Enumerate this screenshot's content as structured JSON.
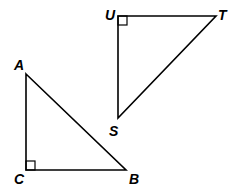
{
  "diagram": {
    "triangles": [
      {
        "name": "ABC",
        "right_angle_at": "C",
        "vertices": {
          "A": {
            "x": 26,
            "y": 74
          },
          "B": {
            "x": 126,
            "y": 170
          },
          "C": {
            "x": 26,
            "y": 170
          }
        }
      },
      {
        "name": "UST",
        "right_angle_at": "U",
        "vertices": {
          "U": {
            "x": 118,
            "y": 16
          },
          "T": {
            "x": 216,
            "y": 16
          },
          "S": {
            "x": 118,
            "y": 118
          }
        }
      }
    ],
    "labels": {
      "A": "A",
      "B": "B",
      "C": "C",
      "U": "U",
      "T": "T",
      "S": "S"
    },
    "line_color": "#000000"
  }
}
